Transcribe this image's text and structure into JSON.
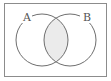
{
  "diagram": {
    "type": "venn",
    "universe_border_color": "#8c8c8c",
    "circle_stroke_color": "#6e6e6e",
    "shaded_region": "A∩B",
    "shade_color": "#ebebeb",
    "sets": [
      {
        "label": "A",
        "cx": 42,
        "cy": 40,
        "r": 26
      },
      {
        "label": "B",
        "cx": 70,
        "cy": 40,
        "r": 26
      }
    ]
  }
}
